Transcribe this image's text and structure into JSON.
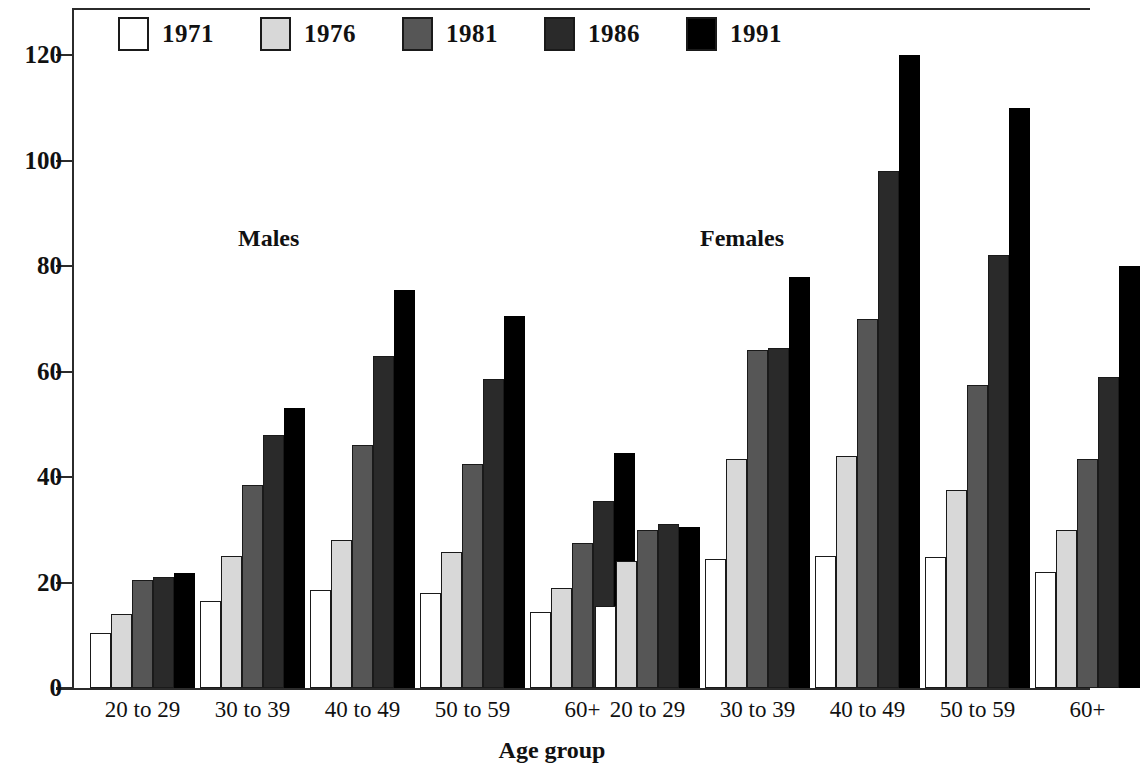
{
  "chart_data": {
    "type": "bar",
    "title": "",
    "xlabel": "Age group",
    "ylabel": "",
    "ylim": [
      0,
      125
    ],
    "yticks": [
      0,
      20,
      40,
      60,
      80,
      100,
      120
    ],
    "grid": false,
    "legend_position": "top-left",
    "panels": [
      {
        "label": "Males"
      },
      {
        "label": "Females"
      }
    ],
    "categories": [
      "20 to 29",
      "30 to 39",
      "40 to 49",
      "50 to 59",
      "60+"
    ],
    "series": [
      {
        "name": "1971",
        "color": "#ffffff",
        "males": [
          10.5,
          16.5,
          18.5,
          18.0,
          14.5
        ],
        "females": [
          15.5,
          24.5,
          25.0,
          24.8,
          22.0
        ]
      },
      {
        "name": "1976",
        "color": "#d8d8d8",
        "males": [
          14.0,
          25.0,
          28.0,
          25.8,
          19.0
        ],
        "females": [
          24.0,
          43.5,
          44.0,
          37.5,
          30.0
        ]
      },
      {
        "name": "1981",
        "color": "#565656",
        "males": [
          20.5,
          38.5,
          46.0,
          42.5,
          27.5
        ],
        "females": [
          30.0,
          64.0,
          70.0,
          57.5,
          43.5
        ]
      },
      {
        "name": "1986",
        "color": "#2a2a2a",
        "males": [
          21.0,
          48.0,
          63.0,
          58.5,
          35.5
        ],
        "females": [
          31.0,
          64.5,
          98.0,
          82.0,
          59.0
        ]
      },
      {
        "name": "1991",
        "color": "#000000",
        "males": [
          21.8,
          53.0,
          75.5,
          70.5,
          44.5
        ],
        "females": [
          30.5,
          78.0,
          120.0,
          110.0,
          80.0
        ]
      }
    ]
  }
}
